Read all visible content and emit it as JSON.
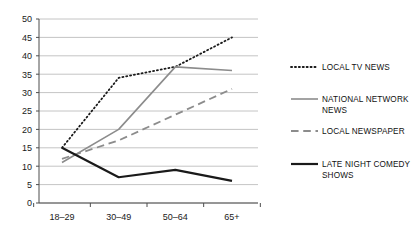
{
  "chart_data": {
    "type": "line",
    "title": "",
    "xlabel": "",
    "ylabel": "",
    "categories": [
      "18–29",
      "30–49",
      "50–64",
      "65+"
    ],
    "ylim": [
      0,
      50
    ],
    "ytick_step": 5,
    "yticks": [
      "50",
      "45",
      "40",
      "35",
      "30",
      "25",
      "20",
      "15",
      "10",
      "5",
      "0"
    ],
    "grid": true,
    "legend_position": "right",
    "series": [
      {
        "name": "LOCAL TV NEWS",
        "style": "dotted",
        "color": "#1a1a1a",
        "width": 1.8,
        "values": [
          15,
          34,
          37,
          45
        ]
      },
      {
        "name": "NATIONAL NETWORK NEWS",
        "style": "solid",
        "color": "#8c8c8c",
        "width": 1.6,
        "values": [
          11,
          20,
          37,
          36
        ]
      },
      {
        "name": "LOCAL NEWSPAPER",
        "style": "dashed",
        "color": "#8c8c8c",
        "width": 1.8,
        "values": [
          12,
          17,
          24,
          31
        ]
      },
      {
        "name": "LATE NIGHT COMEDY SHOWS",
        "style": "solid",
        "color": "#1a1a1a",
        "width": 2.2,
        "values": [
          15,
          7,
          9,
          6
        ]
      }
    ]
  },
  "legend": {
    "entries": [
      {
        "label_line1": "LOCAL TV NEWS",
        "label_line2": ""
      },
      {
        "label_line1": "NATIONAL NETWORK",
        "label_line2": "NEWS"
      },
      {
        "label_line1": "LOCAL NEWSPAPER",
        "label_line2": ""
      },
      {
        "label_line1": "LATE NIGHT COMEDY",
        "label_line2": "SHOWS"
      }
    ]
  },
  "colors": {
    "grid": "#b5b5b5",
    "axis": "#4d4d4d",
    "dark_series": "#1a1a1a",
    "gray_series": "#8c8c8c",
    "text": "#111111",
    "background": "#ffffff"
  }
}
